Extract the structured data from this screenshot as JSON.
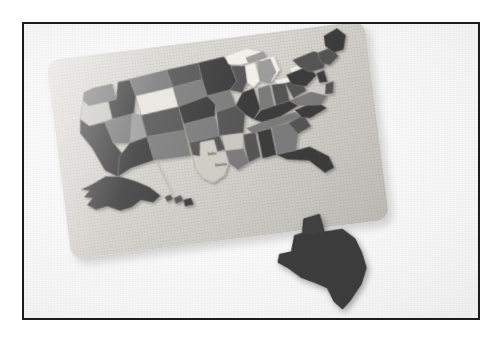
{
  "scene": {
    "kind": "photograph",
    "subject": "United States jigsaw puzzle map on a tray board",
    "caption": "Photograph of a US map jigsaw puzzle with the Texas piece removed and lying below the board",
    "frame_border_color": "#1c1c1c",
    "background_color": "#fdfdfd"
  },
  "board": {
    "label": "puzzle-tray",
    "fill_color": "#d7d5cf",
    "rotation_deg": -7.2,
    "corner_radius_px": 12
  },
  "palette": {
    "piece_dark": "#3c3c3c",
    "piece_mid_dark": "#565656",
    "piece_mid": "#7b7b7b",
    "piece_mid_light": "#9d9d9d",
    "piece_light": "#c9c7c1",
    "piece_very_light": "#e8e6e0",
    "lake_white": "#f2f0ea",
    "empty_slot": "#ceccc5",
    "outline": "#8d8b85"
  },
  "pieces": [
    {
      "name": "washington",
      "label": "WA",
      "tone": "piece_mid"
    },
    {
      "name": "oregon",
      "label": "OR",
      "tone": "piece_light"
    },
    {
      "name": "california",
      "label": "CA",
      "tone": "piece_dark"
    },
    {
      "name": "nevada",
      "label": "NV",
      "tone": "piece_mid"
    },
    {
      "name": "idaho",
      "label": "ID",
      "tone": "piece_dark"
    },
    {
      "name": "montana",
      "label": "MT",
      "tone": "piece_mid"
    },
    {
      "name": "wyoming",
      "label": "WY",
      "tone": "piece_very_light"
    },
    {
      "name": "utah",
      "label": "UT",
      "tone": "piece_mid_light"
    },
    {
      "name": "arizona",
      "label": "AZ",
      "tone": "piece_dark"
    },
    {
      "name": "colorado",
      "label": "CO",
      "tone": "piece_mid_dark"
    },
    {
      "name": "new-mexico",
      "label": "NM",
      "tone": "piece_mid"
    },
    {
      "name": "north-dakota",
      "label": "ND",
      "tone": "piece_mid_dark"
    },
    {
      "name": "south-dakota",
      "label": "SD",
      "tone": "piece_mid"
    },
    {
      "name": "nebraska",
      "label": "NE",
      "tone": "piece_dark"
    },
    {
      "name": "kansas",
      "label": "KS",
      "tone": "piece_mid"
    },
    {
      "name": "oklahoma",
      "label": "OK",
      "tone": "piece_mid_dark"
    },
    {
      "name": "minnesota",
      "label": "MN",
      "tone": "piece_dark"
    },
    {
      "name": "iowa",
      "label": "IA",
      "tone": "piece_mid"
    },
    {
      "name": "missouri",
      "label": "MO",
      "tone": "piece_mid_dark"
    },
    {
      "name": "arkansas",
      "label": "AR",
      "tone": "piece_light"
    },
    {
      "name": "louisiana",
      "label": "LA",
      "tone": "piece_mid"
    },
    {
      "name": "wisconsin",
      "label": "WI",
      "tone": "piece_mid_dark"
    },
    {
      "name": "illinois",
      "label": "IL",
      "tone": "piece_dark"
    },
    {
      "name": "michigan",
      "label": "MI",
      "tone": "piece_mid_light"
    },
    {
      "name": "indiana",
      "label": "IN",
      "tone": "piece_mid"
    },
    {
      "name": "ohio",
      "label": "OH",
      "tone": "piece_mid_dark"
    },
    {
      "name": "kentucky",
      "label": "KY",
      "tone": "piece_dark"
    },
    {
      "name": "tennessee",
      "label": "TN",
      "tone": "piece_mid"
    },
    {
      "name": "mississippi",
      "label": "MS",
      "tone": "piece_mid_dark"
    },
    {
      "name": "alabama",
      "label": "AL",
      "tone": "piece_dark"
    },
    {
      "name": "georgia",
      "label": "GA",
      "tone": "piece_mid"
    },
    {
      "name": "florida",
      "label": "FL",
      "tone": "piece_dark"
    },
    {
      "name": "south-carolina",
      "label": "SC",
      "tone": "piece_mid_dark"
    },
    {
      "name": "north-carolina",
      "label": "NC",
      "tone": "piece_dark"
    },
    {
      "name": "virginia",
      "label": "VA",
      "tone": "piece_mid"
    },
    {
      "name": "west-virginia",
      "label": "WV",
      "tone": "piece_mid_dark"
    },
    {
      "name": "pennsylvania",
      "label": "PA",
      "tone": "piece_dark"
    },
    {
      "name": "new-york",
      "label": "NY",
      "tone": "piece_mid_dark"
    },
    {
      "name": "maine",
      "label": "ME",
      "tone": "piece_dark"
    },
    {
      "name": "new-england",
      "label": "NE-states",
      "tone": "piece_mid_dark"
    },
    {
      "name": "alaska",
      "label": "AK",
      "tone": "piece_dark"
    },
    {
      "name": "hawaii",
      "label": "HI",
      "tone": "piece_mid_dark"
    }
  ],
  "detached_piece": {
    "name": "texas",
    "label": "TX",
    "tone": "piece_dark",
    "state": "removed-from-board",
    "position": "below board, overlapping lower edge"
  },
  "empty_slot": {
    "name": "texas-slot",
    "state": "empty",
    "inner_labels": [
      "Dallas",
      "Houston"
    ]
  },
  "great_lakes": {
    "name": "great-lakes",
    "tone": "lake_white",
    "lakes": [
      "Superior",
      "Michigan",
      "Huron",
      "Erie",
      "Ontario"
    ]
  }
}
